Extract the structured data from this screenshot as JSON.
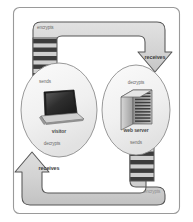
{
  "diagram": {
    "type": "cycle-flow",
    "colors": {
      "frame_border": "#9a9a9a",
      "path_fill": "#d4d4d4",
      "path_stroke": "#555555",
      "ellipse_fill": "#f2f2f2",
      "ellipse_stroke": "#8a8a8a",
      "stripe_dark": "#3a3a3a",
      "stripe_light": "#c9c9c9",
      "background": "#ffffff"
    },
    "nodes": [
      {
        "id": "visitor",
        "label": "visitor",
        "icon": "laptop-icon"
      },
      {
        "id": "web-server",
        "label": "web server",
        "icon": "server-tower-icon"
      }
    ],
    "steps": [
      {
        "id": "step-encrypts-top",
        "label": "encrypts",
        "position": "top-left"
      },
      {
        "id": "step-sends-left",
        "label": "sends",
        "position": "left-upper"
      },
      {
        "id": "step-receives-right",
        "label": "receives",
        "position": "right-upper"
      },
      {
        "id": "step-decrypts-right",
        "label": "decrypts",
        "position": "right-inner-top"
      },
      {
        "id": "step-sends-right",
        "label": "sends",
        "position": "right-inner-bottom"
      },
      {
        "id": "step-encrypts-bottom",
        "label": "encrypts",
        "position": "bottom-right"
      },
      {
        "id": "step-receives-left",
        "label": "receives",
        "position": "bottom-left"
      },
      {
        "id": "step-decrypts-left",
        "label": "decrypts",
        "position": "left-lower"
      }
    ],
    "bands": [
      {
        "id": "band-top-left",
        "label": "encrypted-data-band"
      },
      {
        "id": "band-bottom-right",
        "label": "encrypted-data-band"
      }
    ]
  }
}
